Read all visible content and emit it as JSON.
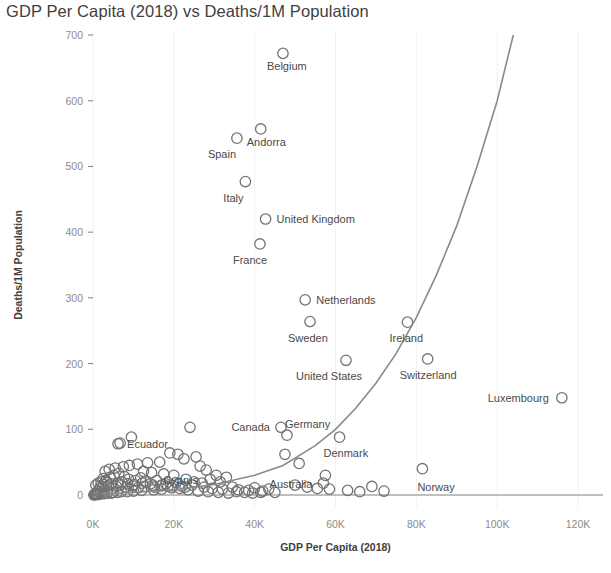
{
  "chart_data": {
    "type": "scatter",
    "title": "GDP Per Capita (2018) vs Deaths/1M Population",
    "xlabel": "GDP Per Capita (2018)",
    "ylabel": "Deaths/1M Population",
    "xlim": [
      0,
      122000
    ],
    "ylim": [
      0,
      730
    ],
    "xticks": [
      0,
      20000,
      40000,
      60000,
      80000,
      100000,
      120000
    ],
    "xticklabels": [
      "0K",
      "20K",
      "40K",
      "60K",
      "80K",
      "100K",
      "120K"
    ],
    "yticks": [
      0,
      100,
      200,
      300,
      400,
      500,
      600,
      700
    ],
    "yticklabels": [
      "0",
      "100",
      "200",
      "300",
      "400",
      "500",
      "600",
      "700"
    ],
    "grid": "vertical-faint",
    "legend": "none",
    "marker_style": "open-circle",
    "trendline": {
      "name": "Exponential trend",
      "type": "exponential",
      "color": "#8a8a8a",
      "points": [
        [
          2000,
          2
        ],
        [
          10000,
          4
        ],
        [
          20000,
          8
        ],
        [
          30000,
          16
        ],
        [
          40000,
          30
        ],
        [
          47000,
          45
        ],
        [
          55000,
          75
        ],
        [
          60000,
          100
        ],
        [
          65000,
          132
        ],
        [
          70000,
          170
        ],
        [
          75000,
          215
        ],
        [
          80000,
          270
        ],
        [
          85000,
          335
        ],
        [
          90000,
          410
        ],
        [
          95000,
          500
        ],
        [
          100000,
          600
        ],
        [
          104000,
          700
        ]
      ]
    },
    "labeled_points": [
      {
        "label": "Belgium",
        "x": 47000,
        "y": 672,
        "label_dx": -16,
        "label_dy": 17
      },
      {
        "label": "Andorra",
        "x": 41500,
        "y": 557,
        "label_dx": -14,
        "label_dy": 17
      },
      {
        "label": "Spain",
        "x": 35600,
        "y": 543,
        "label_dx": -29,
        "label_dy": 20
      },
      {
        "label": "Italy",
        "x": 37700,
        "y": 477,
        "label_dx": -22,
        "label_dy": 20
      },
      {
        "label": "United Kingdom",
        "x": 42700,
        "y": 420,
        "label_dx": 11,
        "label_dy": 4
      },
      {
        "label": "France",
        "x": 41300,
        "y": 382,
        "label_dx": -27,
        "label_dy": 20
      },
      {
        "label": "Netherlands",
        "x": 52500,
        "y": 297,
        "label_dx": 11,
        "label_dy": 4
      },
      {
        "label": "Sweden",
        "x": 53700,
        "y": 264,
        "label_dx": -22,
        "label_dy": 20
      },
      {
        "label": "Ireland",
        "x": 77800,
        "y": 263,
        "label_dx": -18,
        "label_dy": 20
      },
      {
        "label": "United States",
        "x": 62600,
        "y": 205,
        "label_dx": -50,
        "label_dy": 20
      },
      {
        "label": "Switzerland",
        "x": 82800,
        "y": 207,
        "label_dx": -28,
        "label_dy": 20
      },
      {
        "label": "Luxembourg",
        "x": 116000,
        "y": 148,
        "label_dx": -13,
        "label_dy": 4,
        "anchor": "end"
      },
      {
        "label": "Canada",
        "x": 46500,
        "y": 103,
        "label_dx": -11,
        "label_dy": 4,
        "anchor": "end"
      },
      {
        "label": "Germany",
        "x": 48000,
        "y": 91,
        "label_dx": -2,
        "label_dy": -7
      },
      {
        "label": "Denmark",
        "x": 61000,
        "y": 88,
        "label_dx": -16,
        "label_dy": 20
      },
      {
        "label": "Ecuador",
        "x": 6200,
        "y": 78,
        "label_dx": 9,
        "label_dy": 4
      },
      {
        "label": "Cyprus",
        "x": 29000,
        "y": 24,
        "label_dx": -12,
        "label_dy": 5,
        "anchor": "end"
      },
      {
        "label": "Australia",
        "x": 57000,
        "y": 18,
        "label_dx": -11,
        "label_dy": 5,
        "anchor": "end"
      },
      {
        "label": "Norway",
        "x": 81500,
        "y": 40,
        "label_dx": -5,
        "label_dy": 22
      }
    ],
    "unlabeled_points": [
      [
        24000,
        103
      ],
      [
        6700,
        79
      ],
      [
        9500,
        88
      ],
      [
        19000,
        64
      ],
      [
        21000,
        62
      ],
      [
        25500,
        58
      ],
      [
        22500,
        55
      ],
      [
        16500,
        50
      ],
      [
        13500,
        49
      ],
      [
        11000,
        47
      ],
      [
        9000,
        45
      ],
      [
        7500,
        43
      ],
      [
        5500,
        41
      ],
      [
        4000,
        39
      ],
      [
        3000,
        36
      ],
      [
        12500,
        36
      ],
      [
        14500,
        34
      ],
      [
        17500,
        32
      ],
      [
        20000,
        30
      ],
      [
        26500,
        44
      ],
      [
        28000,
        38
      ],
      [
        30500,
        30
      ],
      [
        33000,
        27
      ],
      [
        31500,
        20
      ],
      [
        27000,
        18
      ],
      [
        24500,
        15
      ],
      [
        22000,
        13
      ],
      [
        19500,
        11
      ],
      [
        17000,
        9
      ],
      [
        15000,
        8
      ],
      [
        12000,
        7
      ],
      [
        10000,
        6
      ],
      [
        8500,
        5
      ],
      [
        7000,
        5
      ],
      [
        6000,
        4
      ],
      [
        5000,
        4
      ],
      [
        4500,
        3
      ],
      [
        3500,
        3
      ],
      [
        2800,
        2
      ],
      [
        2200,
        2
      ],
      [
        1800,
        2
      ],
      [
        1400,
        1
      ],
      [
        1100,
        1
      ],
      [
        900,
        1
      ],
      [
        700,
        1
      ],
      [
        500,
        1
      ],
      [
        350,
        1
      ],
      [
        250,
        0
      ],
      [
        2000,
        20
      ],
      [
        2500,
        25
      ],
      [
        3200,
        22
      ],
      [
        4200,
        27
      ],
      [
        5200,
        30
      ],
      [
        6400,
        33
      ],
      [
        7800,
        28
      ],
      [
        8800,
        24
      ],
      [
        10500,
        22
      ],
      [
        11800,
        26
      ],
      [
        13000,
        20
      ],
      [
        14200,
        17
      ],
      [
        15800,
        22
      ],
      [
        18000,
        17
      ],
      [
        20500,
        19
      ],
      [
        23000,
        24
      ],
      [
        25000,
        20
      ],
      [
        27500,
        12
      ],
      [
        29500,
        10
      ],
      [
        32000,
        9
      ],
      [
        34500,
        12
      ],
      [
        36000,
        8
      ],
      [
        38500,
        7
      ],
      [
        40000,
        11
      ],
      [
        42000,
        6
      ],
      [
        43500,
        9
      ],
      [
        45000,
        4
      ],
      [
        1200,
        6
      ],
      [
        1600,
        9
      ],
      [
        2400,
        12
      ],
      [
        3800,
        14
      ],
      [
        4800,
        10
      ],
      [
        5800,
        13
      ],
      [
        6800,
        15
      ],
      [
        8200,
        12
      ],
      [
        9800,
        14
      ],
      [
        11200,
        11
      ],
      [
        12800,
        13
      ],
      [
        15200,
        12
      ],
      [
        16800,
        14
      ],
      [
        18500,
        13
      ],
      [
        21500,
        10
      ],
      [
        23500,
        8
      ],
      [
        26000,
        6
      ],
      [
        28500,
        5
      ],
      [
        31000,
        4
      ],
      [
        33500,
        3
      ],
      [
        35500,
        5
      ],
      [
        37500,
        4
      ],
      [
        39500,
        3
      ],
      [
        41500,
        4
      ],
      [
        50000,
        15
      ],
      [
        53000,
        12
      ],
      [
        55500,
        10
      ],
      [
        58500,
        9
      ],
      [
        63000,
        7
      ],
      [
        66000,
        5
      ],
      [
        69000,
        13
      ],
      [
        72000,
        6
      ],
      [
        47500,
        62
      ],
      [
        51000,
        48
      ],
      [
        57500,
        30
      ],
      [
        700,
        15
      ],
      [
        1300,
        18
      ],
      [
        1900,
        14
      ],
      [
        2600,
        16
      ],
      [
        3400,
        19
      ],
      [
        4600,
        17
      ],
      [
        6200,
        18
      ],
      [
        7200,
        20
      ],
      [
        8600,
        17
      ],
      [
        10200,
        16
      ],
      [
        12200,
        18
      ],
      [
        14800,
        15
      ],
      [
        17200,
        16
      ],
      [
        19800,
        14
      ],
      [
        22800,
        12
      ]
    ]
  }
}
